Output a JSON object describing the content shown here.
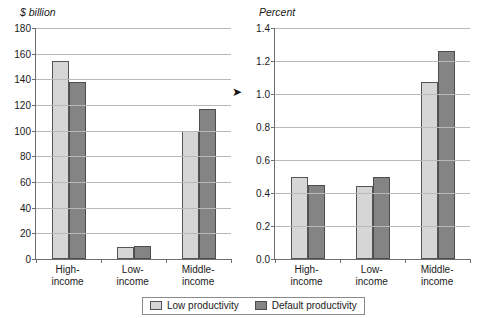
{
  "figure": {
    "title": "",
    "legend": {
      "items": [
        {
          "label": "Low productivity",
          "color": "#d6d6d6",
          "key": "low"
        },
        {
          "label": "Default productivity",
          "color": "#848484",
          "key": "default"
        }
      ]
    },
    "marker": {
      "name": "arrow-marker",
      "glyph": "➤"
    }
  },
  "chart_data": [
    {
      "type": "bar",
      "panel": "left",
      "title": "",
      "xlabel": "",
      "ylabel": "$ billion",
      "ylim": [
        0,
        180
      ],
      "yticks": [
        0,
        20,
        40,
        60,
        80,
        100,
        120,
        140,
        160,
        180
      ],
      "ytick_labels": [
        "0",
        "20",
        "40",
        "60",
        "80",
        "100",
        "120",
        "140",
        "160",
        "180"
      ],
      "grid": true,
      "legend_position": "bottom-center",
      "categories": [
        "High-\nincome",
        "Low-\nincome",
        "Middle-\nincome"
      ],
      "category_lines": [
        [
          "High-",
          "income"
        ],
        [
          "Low-",
          "income"
        ],
        [
          "Middle-",
          "income"
        ]
      ],
      "series": [
        {
          "name": "Low productivity",
          "color": "#d6d6d6",
          "values": [
            154,
            9,
            100
          ]
        },
        {
          "name": "Default productivity",
          "color": "#848484",
          "values": [
            138,
            10.5,
            117
          ]
        }
      ]
    },
    {
      "type": "bar",
      "panel": "right",
      "title": "",
      "xlabel": "",
      "ylabel": "Percent",
      "ylim": [
        0,
        1.4
      ],
      "yticks": [
        0.0,
        0.2,
        0.4,
        0.6,
        0.8,
        1.0,
        1.2,
        1.4
      ],
      "ytick_labels": [
        "0.0",
        "0.2",
        "0.4",
        "0.6",
        "0.8",
        "1.0",
        "1.2",
        "1.4"
      ],
      "grid": true,
      "legend_position": "bottom-center",
      "categories": [
        "High-\nincome",
        "Low-\nincome",
        "Middle-\nincome"
      ],
      "category_lines": [
        [
          "High-",
          "income"
        ],
        [
          "Low-",
          "income"
        ],
        [
          "Middle-",
          "income"
        ]
      ],
      "series": [
        {
          "name": "Low productivity",
          "color": "#d6d6d6",
          "values": [
            0.5,
            0.445,
            1.07
          ]
        },
        {
          "name": "Default productivity",
          "color": "#848484",
          "values": [
            0.45,
            0.5,
            1.26
          ]
        }
      ]
    }
  ]
}
